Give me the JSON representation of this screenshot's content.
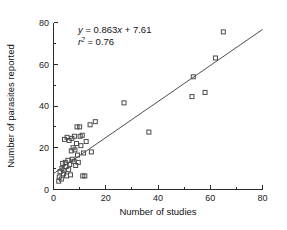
{
  "chart_data": {
    "type": "scatter",
    "title": "",
    "xlabel": "Number of studies",
    "ylabel": "Number of parasites reported",
    "xlim": [
      0,
      80
    ],
    "ylim": [
      0,
      80
    ],
    "xticks": [
      0,
      20,
      40,
      60,
      80
    ],
    "yticks": [
      0,
      20,
      40,
      60,
      80
    ],
    "xtick_labels": [
      "0",
      "20",
      "40",
      "60",
      "80"
    ],
    "ytick_labels": [
      "0",
      "20",
      "40",
      "60",
      "80"
    ],
    "xminor_ticks": [
      10,
      30,
      50,
      70
    ],
    "yminor_ticks": [
      10,
      30,
      50,
      70
    ],
    "grid": false,
    "legend": null,
    "marker": "open-square",
    "marker_color": "#4a4a4a",
    "line_color": "#3a3a3a",
    "annotations": {
      "equation": "y = 0.863x + 7.61",
      "equation_slope": 0.863,
      "equation_intercept": 7.61,
      "r_squared_label": "r2 = 0.76",
      "r_squared": 0.76
    },
    "fit_line": {
      "x_start": 0,
      "y_start": 7.61,
      "x_end": 80,
      "y_end": 76.65
    },
    "points": [
      {
        "x": 2.0,
        "y": 4.0
      },
      {
        "x": 2.2,
        "y": 6.0
      },
      {
        "x": 2.5,
        "y": 8.5
      },
      {
        "x": 3.0,
        "y": 5.0
      },
      {
        "x": 3.2,
        "y": 10.0
      },
      {
        "x": 3.5,
        "y": 12.5
      },
      {
        "x": 3.8,
        "y": 7.5
      },
      {
        "x": 4.0,
        "y": 9.0
      },
      {
        "x": 4.2,
        "y": 24.0
      },
      {
        "x": 4.5,
        "y": 13.0
      },
      {
        "x": 4.8,
        "y": 11.0
      },
      {
        "x": 5.0,
        "y": 6.5
      },
      {
        "x": 5.2,
        "y": 25.0
      },
      {
        "x": 5.5,
        "y": 14.0
      },
      {
        "x": 5.8,
        "y": 9.5
      },
      {
        "x": 6.0,
        "y": 23.5
      },
      {
        "x": 6.2,
        "y": 12.0
      },
      {
        "x": 6.5,
        "y": 7.0
      },
      {
        "x": 6.8,
        "y": 18.5
      },
      {
        "x": 7.0,
        "y": 24.5
      },
      {
        "x": 7.2,
        "y": 14.5
      },
      {
        "x": 7.5,
        "y": 20.0
      },
      {
        "x": 7.8,
        "y": 13.5
      },
      {
        "x": 8.0,
        "y": 25.5
      },
      {
        "x": 8.2,
        "y": 19.0
      },
      {
        "x": 8.5,
        "y": 11.5
      },
      {
        "x": 8.8,
        "y": 22.0
      },
      {
        "x": 9.0,
        "y": 30.0
      },
      {
        "x": 9.2,
        "y": 16.5
      },
      {
        "x": 9.5,
        "y": 13.0
      },
      {
        "x": 10.0,
        "y": 30.0
      },
      {
        "x": 10.2,
        "y": 25.5
      },
      {
        "x": 10.5,
        "y": 21.0
      },
      {
        "x": 11.0,
        "y": 26.0
      },
      {
        "x": 11.2,
        "y": 6.5
      },
      {
        "x": 11.5,
        "y": 17.5
      },
      {
        "x": 12.0,
        "y": 6.5
      },
      {
        "x": 12.5,
        "y": 23.0
      },
      {
        "x": 14.0,
        "y": 31.0
      },
      {
        "x": 14.5,
        "y": 18.0
      },
      {
        "x": 16.0,
        "y": 32.5
      },
      {
        "x": 27.0,
        "y": 41.5
      },
      {
        "x": 36.5,
        "y": 27.5
      },
      {
        "x": 53.0,
        "y": 44.5
      },
      {
        "x": 53.5,
        "y": 54.0
      },
      {
        "x": 58.0,
        "y": 46.5
      },
      {
        "x": 62.0,
        "y": 63.0
      },
      {
        "x": 65.0,
        "y": 75.5
      }
    ]
  },
  "figure": {
    "background_color": "#ffffff",
    "axis_color": "#2b2b2b"
  }
}
